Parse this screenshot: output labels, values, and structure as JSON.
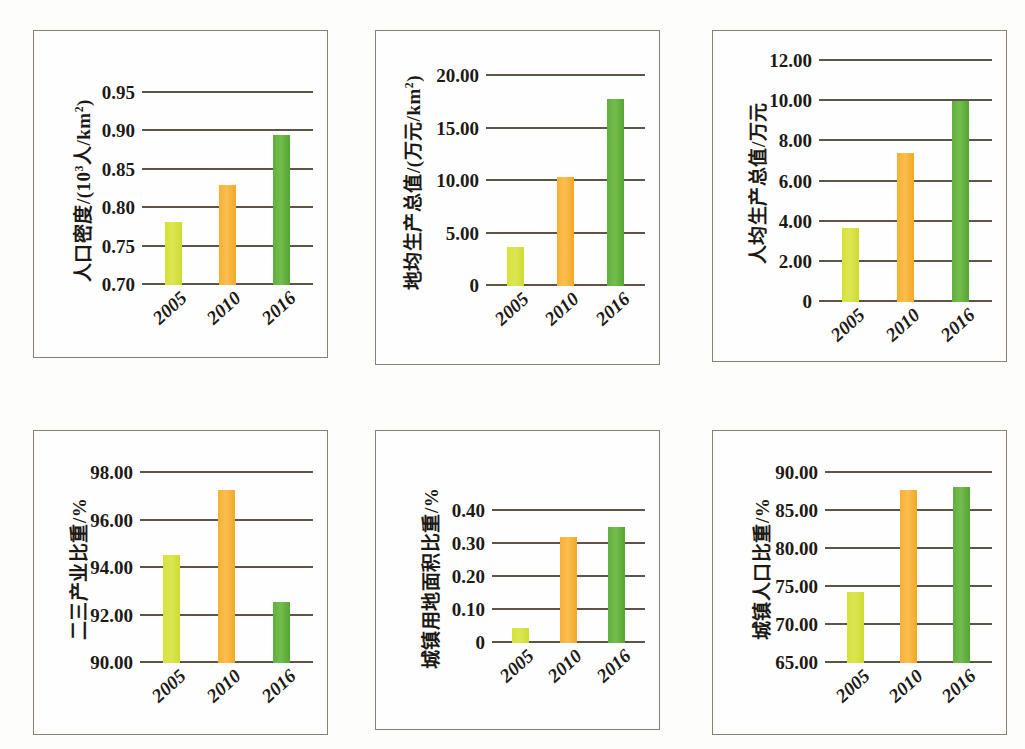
{
  "figure": {
    "background_color": "#fdfdfc",
    "panel_border_color": "#8a8070",
    "gridline_color": "#5d5347",
    "series_colors": [
      "#d8e342",
      "#f7b035",
      "#61b33f"
    ]
  },
  "chart_data": [
    {
      "id": "population-density",
      "type": "bar",
      "title": "",
      "ylabel_parts": {
        "pre": "人口密度/(10",
        "sup": "3",
        "post": "人/km",
        "sup2": "2",
        "tail": ")"
      },
      "ylabel": "人口密度/(10³人/km²)",
      "xlabel": "",
      "categories": [
        "2005",
        "2010",
        "2016"
      ],
      "values": [
        0.782,
        0.83,
        0.895
      ],
      "ylim": [
        0.7,
        0.95
      ],
      "yticks": [
        "0.70",
        "0.75",
        "0.80",
        "0.85",
        "0.90",
        "0.95"
      ],
      "ytick_values": [
        0.7,
        0.75,
        0.8,
        0.85,
        0.9,
        0.95
      ],
      "grid": true,
      "legend": "none"
    },
    {
      "id": "land-gdp-density",
      "type": "bar",
      "title": "",
      "ylabel_parts": {
        "pre": "地均生产总值/(万元/km",
        "sup": "2",
        "post": ")",
        "sup2": "",
        "tail": ""
      },
      "ylabel": "地均生产总值/(万元/km²)",
      "xlabel": "",
      "categories": [
        "2005",
        "2010",
        "2016"
      ],
      "values": [
        3.7,
        10.4,
        17.8
      ],
      "ylim": [
        0,
        20.0
      ],
      "yticks": [
        "0",
        "5.00",
        "10.00",
        "15.00",
        "20.00"
      ],
      "ytick_values": [
        0,
        5.0,
        10.0,
        15.0,
        20.0
      ],
      "grid": true,
      "legend": "none"
    },
    {
      "id": "per-capita-gdp",
      "type": "bar",
      "title": "",
      "ylabel_parts": {
        "pre": "人均生产总值/万元",
        "sup": "",
        "post": "",
        "sup2": "",
        "tail": ""
      },
      "ylabel": "人均生产总值/万元",
      "xlabel": "",
      "categories": [
        "2005",
        "2010",
        "2016"
      ],
      "values": [
        3.7,
        7.4,
        10.0
      ],
      "ylim": [
        0,
        12.0
      ],
      "yticks": [
        "0",
        "2.00",
        "4.00",
        "6.00",
        "8.00",
        "10.00",
        "12.00"
      ],
      "ytick_values": [
        0,
        2.0,
        4.0,
        6.0,
        8.0,
        10.0,
        12.0
      ],
      "grid": true,
      "legend": "none"
    },
    {
      "id": "secondary-tertiary-industry-share",
      "type": "bar",
      "title": "",
      "ylabel_parts": {
        "pre": "二三产业比重/%",
        "sup": "",
        "post": "",
        "sup2": "",
        "tail": ""
      },
      "ylabel": "二三产业比重/%",
      "xlabel": "",
      "categories": [
        "2005",
        "2010",
        "2016"
      ],
      "values": [
        94.55,
        97.3,
        92.55
      ],
      "ylim": [
        90.0,
        98.0
      ],
      "yticks": [
        "90.00",
        "92.00",
        "94.00",
        "96.00",
        "98.00"
      ],
      "ytick_values": [
        90.0,
        92.0,
        94.0,
        96.0,
        98.0
      ],
      "grid": true,
      "legend": "none"
    },
    {
      "id": "urban-land-area-share",
      "type": "bar",
      "title": "",
      "ylabel_parts": {
        "pre": "城镇用地面积比重/%",
        "sup": "",
        "post": "",
        "sup2": "",
        "tail": ""
      },
      "ylabel": "城镇用地面积比重/%",
      "xlabel": "",
      "categories": [
        "2005",
        "2010",
        "2016"
      ],
      "values": [
        0.045,
        0.322,
        0.353
      ],
      "ylim": [
        0,
        0.4
      ],
      "yticks": [
        "0",
        "0.10",
        "0.20",
        "0.30",
        "0.40"
      ],
      "ytick_values": [
        0,
        0.1,
        0.2,
        0.3,
        0.4
      ],
      "grid": true,
      "legend": "none"
    },
    {
      "id": "urban-population-share",
      "type": "bar",
      "title": "",
      "ylabel_parts": {
        "pre": "城镇人口比重/%",
        "sup": "",
        "post": "",
        "sup2": "",
        "tail": ""
      },
      "ylabel": "城镇人口比重/%",
      "xlabel": "",
      "categories": [
        "2005",
        "2010",
        "2016"
      ],
      "values": [
        74.3,
        87.7,
        88.2
      ],
      "ylim": [
        65.0,
        90.0
      ],
      "yticks": [
        "65.00",
        "70.00",
        "75.00",
        "80.00",
        "85.00",
        "90.00"
      ],
      "ytick_values": [
        65.0,
        70.0,
        75.0,
        80.0,
        85.0,
        90.0
      ],
      "grid": true,
      "legend": "none"
    }
  ]
}
